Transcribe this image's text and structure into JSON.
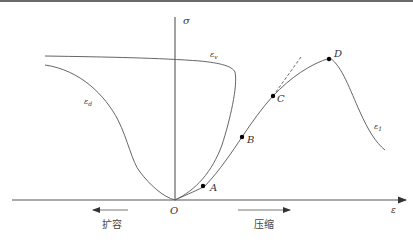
{
  "diagram": {
    "title": "",
    "axes": {
      "y_label": "σ",
      "x_label": "ε",
      "origin_label": "O"
    },
    "curves": [
      {
        "id": "epsilon_v",
        "label": "ε",
        "subscript": "v"
      },
      {
        "id": "epsilon_d",
        "label": "ε",
        "subscript": "d"
      },
      {
        "id": "epsilon_1",
        "label": "ε",
        "subscript": "1"
      }
    ],
    "points": [
      {
        "label": "A"
      },
      {
        "label": "B"
      },
      {
        "label": "C"
      },
      {
        "label": "D"
      }
    ],
    "directions": {
      "left": "扩容",
      "right": "压缩"
    },
    "colors": {
      "line": "#555555",
      "axis": "#444444",
      "point": "#000000",
      "topbar": "#6a6a6a"
    }
  }
}
